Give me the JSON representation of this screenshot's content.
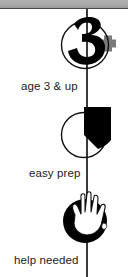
{
  "page": {
    "background_color": "#ffffff",
    "width": 128,
    "height": 277
  },
  "top_band": {
    "fill_color": "#a8a8a8",
    "rule_color": "#4a4a4a"
  },
  "spine": {
    "color": "#3a3a3a",
    "description": "vertical connector line"
  },
  "colors": {
    "ink": "#000000",
    "plus_gray": "#7a7a7a",
    "text": "#1a1a1a",
    "outline": "#111111"
  },
  "steps": [
    {
      "icon": "number-three-plus-icon",
      "icon_glyph": "3+",
      "label": "age 3 & up"
    },
    {
      "icon": "pie-clock-quarter-icon",
      "icon_glyph": "quarter-pie",
      "label": "easy prep"
    },
    {
      "icon": "open-hand-icon",
      "icon_glyph": "hand",
      "label": "help needed"
    }
  ]
}
